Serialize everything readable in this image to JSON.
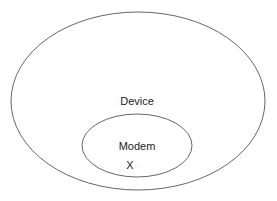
{
  "diagram": {
    "type": "nested-ellipses",
    "outer": {
      "label": "Device",
      "stroke": "#555555"
    },
    "inner": {
      "label": "Modem",
      "stroke": "#555555"
    },
    "marker": {
      "label": "X"
    }
  }
}
